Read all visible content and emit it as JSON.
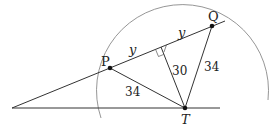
{
  "diagram": {
    "type": "geometry",
    "points": {
      "P": {
        "label": "P",
        "x": 110,
        "y": 68
      },
      "Q": {
        "label": "Q",
        "x": 212,
        "y": 26
      },
      "T": {
        "label": "T",
        "x": 185,
        "y": 108
      }
    },
    "labels": {
      "y_left": "y",
      "y_right": "y",
      "PT": "34",
      "QT": "34",
      "height": "30"
    },
    "colors": {
      "line": "#333333",
      "arc": "#888888",
      "point": "#111111"
    }
  }
}
